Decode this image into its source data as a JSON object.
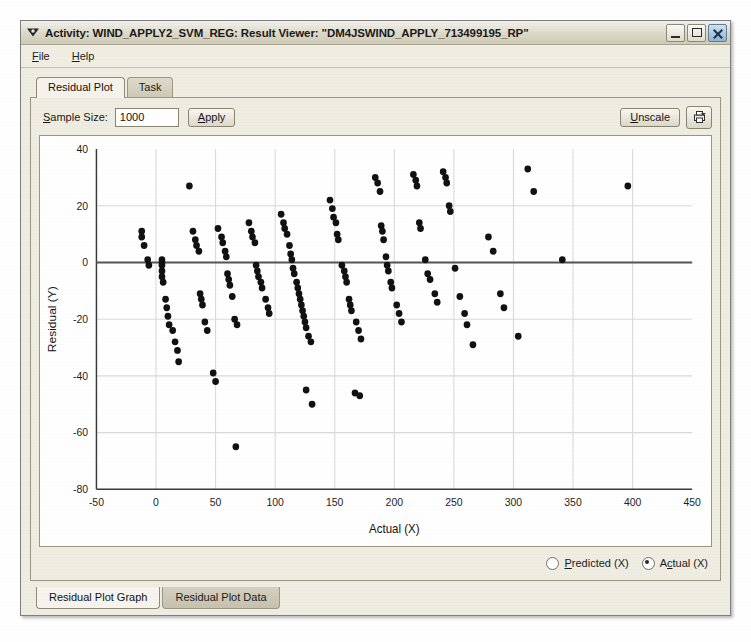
{
  "window": {
    "title": "Activity: WIND_APPLY2_SVM_REG: Result Viewer: \"DM4JSWIND_APPLY_713499195_RP\"",
    "app_icon": "activity-icon",
    "buttons": {
      "minimize": "minimize-icon",
      "maximize": "maximize-icon",
      "close": "close-icon"
    }
  },
  "menubar": {
    "items": [
      {
        "label": "File",
        "mnemonic": "F"
      },
      {
        "label": "Help",
        "mnemonic": "H"
      }
    ]
  },
  "tabs": {
    "top": [
      {
        "label": "Residual Plot",
        "active": true
      },
      {
        "label": "Task",
        "active": false
      }
    ],
    "bottom": [
      {
        "label": "Residual Plot Graph",
        "active": true
      },
      {
        "label": "Residual Plot Data",
        "active": false
      }
    ]
  },
  "controls": {
    "sample_size_label": "Sample Size:",
    "sample_size_value": "1000",
    "apply_label": "Apply",
    "unscale_label": "Unscale",
    "print_icon": "print-icon"
  },
  "radios": [
    {
      "label": "Predicted (X)",
      "checked": false
    },
    {
      "label": "Actual (X)",
      "checked": true
    }
  ],
  "colors": {
    "window_face": "#ece9d8",
    "panel_face": "#efede2",
    "chart_bg": "#ffffff",
    "point": "#111111",
    "grid": "#d8d8d8",
    "zero_line": "#555555",
    "axis": "#3a3a3a"
  },
  "chart_data": {
    "type": "scatter",
    "title": "",
    "xlabel": "Actual (X)",
    "ylabel": "Residual (Y)",
    "xlim": [
      -50,
      450
    ],
    "ylim": [
      -80,
      40
    ],
    "xticks": [
      -50,
      0,
      50,
      100,
      150,
      200,
      250,
      300,
      350,
      400,
      450
    ],
    "yticks": [
      -80,
      -60,
      -40,
      -20,
      0,
      20,
      40
    ],
    "grid": true,
    "legend": null,
    "reference_line": {
      "axis": "y",
      "value": 0
    },
    "marker": {
      "shape": "circle",
      "size": 3.2,
      "color": "#111111"
    },
    "points": [
      [
        -12,
        11
      ],
      [
        -12,
        9
      ],
      [
        -10,
        6
      ],
      [
        -7,
        1
      ],
      [
        -6,
        -1
      ],
      [
        5,
        1
      ],
      [
        5,
        0
      ],
      [
        5,
        -1
      ],
      [
        5,
        -3
      ],
      [
        5,
        -5
      ],
      [
        6,
        -7
      ],
      [
        8,
        -13
      ],
      [
        9,
        -16
      ],
      [
        10,
        -19
      ],
      [
        11,
        -22
      ],
      [
        14,
        -24
      ],
      [
        16,
        -28
      ],
      [
        18,
        -31
      ],
      [
        19,
        -35
      ],
      [
        28,
        27
      ],
      [
        31,
        11
      ],
      [
        33,
        8
      ],
      [
        34,
        6
      ],
      [
        36,
        4
      ],
      [
        37,
        -11
      ],
      [
        38,
        -13
      ],
      [
        39,
        -15
      ],
      [
        41,
        -21
      ],
      [
        43,
        -24
      ],
      [
        48,
        -39
      ],
      [
        50,
        -42
      ],
      [
        52,
        12
      ],
      [
        55,
        9
      ],
      [
        56,
        7
      ],
      [
        58,
        4
      ],
      [
        59,
        2
      ],
      [
        60,
        -4
      ],
      [
        61,
        -6
      ],
      [
        62,
        -8
      ],
      [
        64,
        -12
      ],
      [
        66,
        -20
      ],
      [
        68,
        -22
      ],
      [
        67,
        -65
      ],
      [
        78,
        14
      ],
      [
        80,
        11
      ],
      [
        81,
        9
      ],
      [
        83,
        7
      ],
      [
        84,
        -1
      ],
      [
        85,
        -3
      ],
      [
        86,
        -5
      ],
      [
        88,
        -7
      ],
      [
        89,
        -9
      ],
      [
        92,
        -13
      ],
      [
        94,
        -16
      ],
      [
        95,
        -18
      ],
      [
        105,
        17
      ],
      [
        107,
        14
      ],
      [
        108,
        12
      ],
      [
        110,
        10
      ],
      [
        112,
        6
      ],
      [
        113,
        3
      ],
      [
        114,
        1
      ],
      [
        115,
        -2
      ],
      [
        116,
        -4
      ],
      [
        118,
        -7
      ],
      [
        119,
        -9
      ],
      [
        120,
        -11
      ],
      [
        121,
        -13
      ],
      [
        122,
        -15
      ],
      [
        123,
        -17
      ],
      [
        124,
        -19
      ],
      [
        125,
        -21
      ],
      [
        126,
        -23
      ],
      [
        128,
        -26
      ],
      [
        130,
        -28
      ],
      [
        126,
        -45
      ],
      [
        131,
        -50
      ],
      [
        146,
        22
      ],
      [
        148,
        19
      ],
      [
        149,
        16
      ],
      [
        151,
        14
      ],
      [
        152,
        10
      ],
      [
        153,
        8
      ],
      [
        156,
        -1
      ],
      [
        158,
        -3
      ],
      [
        159,
        -5
      ],
      [
        160,
        -7
      ],
      [
        162,
        -13
      ],
      [
        163,
        -15
      ],
      [
        164,
        -17
      ],
      [
        168,
        -21
      ],
      [
        170,
        -24
      ],
      [
        172,
        -27
      ],
      [
        167,
        -46
      ],
      [
        171,
        -47
      ],
      [
        184,
        30
      ],
      [
        186,
        28
      ],
      [
        188,
        25
      ],
      [
        189,
        13
      ],
      [
        190,
        11
      ],
      [
        191,
        8
      ],
      [
        193,
        2
      ],
      [
        194,
        -1
      ],
      [
        195,
        -3
      ],
      [
        197,
        -7
      ],
      [
        198,
        -9
      ],
      [
        202,
        -15
      ],
      [
        204,
        -18
      ],
      [
        206,
        -21
      ],
      [
        216,
        31
      ],
      [
        218,
        29
      ],
      [
        219,
        27
      ],
      [
        221,
        14
      ],
      [
        222,
        12
      ],
      [
        226,
        1
      ],
      [
        228,
        -4
      ],
      [
        230,
        -6
      ],
      [
        234,
        -11
      ],
      [
        236,
        -14
      ],
      [
        241,
        32
      ],
      [
        243,
        30
      ],
      [
        244,
        28
      ],
      [
        246,
        20
      ],
      [
        247,
        18
      ],
      [
        251,
        -2
      ],
      [
        255,
        -12
      ],
      [
        259,
        -18
      ],
      [
        261,
        -22
      ],
      [
        266,
        -29
      ],
      [
        279,
        9
      ],
      [
        283,
        4
      ],
      [
        289,
        -11
      ],
      [
        292,
        -16
      ],
      [
        304,
        -26
      ],
      [
        312,
        33
      ],
      [
        317,
        25
      ],
      [
        341,
        1
      ],
      [
        396,
        27
      ]
    ]
  }
}
